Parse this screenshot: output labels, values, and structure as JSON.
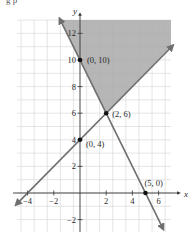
{
  "header": {
    "cut_text": "g p"
  },
  "chart_data": {
    "type": "line",
    "title": "",
    "xlabel": "x",
    "ylabel": "y",
    "xlim": [
      -4.8,
      7
    ],
    "ylim": [
      -3,
      13
    ],
    "grid": true,
    "x_ticks": [
      -4,
      -2,
      2,
      4,
      6
    ],
    "y_ticks": [
      -2,
      2,
      4,
      6,
      8,
      10,
      12
    ],
    "x_tick_labels": [
      "−4",
      "−2",
      "2",
      "4",
      "6"
    ],
    "y_tick_labels": [
      "−2",
      "2",
      "4",
      "6",
      "8",
      "10",
      "12"
    ],
    "series": [
      {
        "name": "line through (0,4) and (2,6)",
        "equation": "y = x + 4",
        "points": [
          [
            -4.8,
            -0.8
          ],
          [
            7,
            11
          ]
        ]
      },
      {
        "name": "line through (0,10) and (5,0)",
        "equation": "y = -2x + 10",
        "points": [
          [
            -1.5,
            13
          ],
          [
            6.3,
            -2.6
          ]
        ]
      }
    ],
    "shaded_region": {
      "description": "feasible region above both lines",
      "vertices": [
        [
          -1.5,
          13
        ],
        [
          7,
          13
        ],
        [
          7,
          11
        ],
        [
          2,
          6
        ]
      ],
      "color": "#a9a9a9"
    },
    "points": [
      {
        "x": 0,
        "y": 10,
        "label": "(0, 10)"
      },
      {
        "x": 2,
        "y": 6,
        "label": "(2, 6)"
      },
      {
        "x": 0,
        "y": 4,
        "label": "(0, 4)"
      },
      {
        "x": 5,
        "y": 0,
        "label": "(5, 0)"
      }
    ],
    "colors": {
      "line": "#6f6f6f",
      "shade": "#a9a9a9",
      "grid": "#d4d4d4",
      "axis": "#333333",
      "point": "#111111"
    }
  }
}
